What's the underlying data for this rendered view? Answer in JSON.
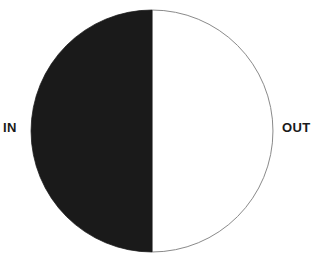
{
  "figure": {
    "background_color": "#ffffff",
    "width": 318,
    "height": 263
  },
  "chart_data": {
    "type": "pie",
    "title": "",
    "subtitle": "",
    "xlabel": "",
    "ylabel": "",
    "grid": false,
    "legend_position": "none",
    "labels_position": "outside",
    "total": 100,
    "categories": [
      "IN",
      "OUT"
    ],
    "values": [
      50,
      50
    ],
    "start_angle_deg": 0,
    "direction": "clockwise",
    "slices": [
      {
        "label": "IN",
        "value": 50,
        "percent": "50%",
        "fill": "#ffffff",
        "stroke": "#8a8a8a",
        "side": "left"
      },
      {
        "label": "OUT",
        "value": 50,
        "percent": "50%",
        "fill": "#1a1a1a",
        "stroke": "#1a1a1a",
        "side": "right"
      }
    ],
    "geometry": {
      "center_x": 152,
      "center_y": 131,
      "radius": 121,
      "outline_width": 1
    },
    "colors": {
      "in_fill": "#ffffff",
      "out_fill": "#1a1a1a",
      "outline": "#8a8a8a",
      "label_text": "#1a1a1a"
    }
  },
  "labels": {
    "in": "IN",
    "out": "OUT"
  }
}
